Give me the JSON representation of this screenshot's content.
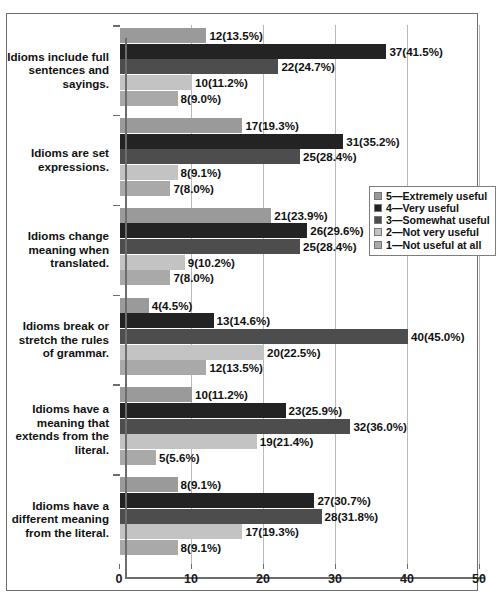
{
  "chart_data": {
    "type": "bar",
    "orientation": "horizontal",
    "title": "",
    "xlabel": "",
    "ylabel": "",
    "xlim": [
      0,
      50
    ],
    "xticks": [
      0,
      10,
      20,
      30,
      40,
      50
    ],
    "grid": true,
    "legend_position": "right",
    "categories": [
      "Idioms include full sentences and sayings.",
      "Idioms are set expressions.",
      "Idioms change meaning when translated.",
      "Idioms break or stretch the rules of grammar.",
      "Idioms have a meaning that extends from the literal.",
      "Idioms have a different meaning from the literal."
    ],
    "series": [
      {
        "name": "5—Extremely useful",
        "color": "#9a9a9a",
        "values": [
          12,
          17,
          21,
          4,
          10,
          8
        ],
        "labels": [
          "12(13.5%)",
          "17(19.3%)",
          "21(23.9%)",
          "4(4.5%)",
          "10(11.2%)",
          "8(9.1%)"
        ]
      },
      {
        "name": "4—Very useful",
        "color": "#232323",
        "values": [
          37,
          31,
          26,
          13,
          23,
          27
        ],
        "labels": [
          "37(41.5%)",
          "31(35.2%)",
          "26(29.6%)",
          "13(14.6%)",
          "23(25.9%)",
          "27(30.7%)"
        ]
      },
      {
        "name": "3—Somewhat useful",
        "color": "#4d4d4d",
        "values": [
          22,
          25,
          25,
          40,
          32,
          28
        ],
        "labels": [
          "22(24.7%)",
          "25(28.4%)",
          "25(28.4%)",
          "40(45.0%)",
          "32(36.0%)",
          "28(31.8%)"
        ]
      },
      {
        "name": "2—Not very useful",
        "color": "#c3c3c3",
        "values": [
          10,
          8,
          9,
          20,
          19,
          17
        ],
        "labels": [
          "10(11.2%)",
          "8(9.1%)",
          "9(10.2%)",
          "20(22.5%)",
          "19(21.4%)",
          "17(19.3%)"
        ]
      },
      {
        "name": "1—Not useful at all",
        "color": "#a9a9a9",
        "values": [
          8,
          7,
          7,
          12,
          5,
          8
        ],
        "labels": [
          "8(9.0%)",
          "7(8.0%)",
          "7(8.0%)",
          "12(13.5%)",
          "5(5.6%)",
          "8(9.1%)"
        ]
      }
    ]
  },
  "axis": {
    "tick_labels": [
      "0",
      "10",
      "20",
      "30",
      "40",
      "50"
    ]
  },
  "legend": {
    "items": [
      {
        "label": "5—Extremely useful",
        "color": "#9a9a9a"
      },
      {
        "label": "4—Very useful",
        "color": "#232323"
      },
      {
        "label": "3—Somewhat useful",
        "color": "#4d4d4d"
      },
      {
        "label": "2—Not very useful",
        "color": "#c3c3c3"
      },
      {
        "label": "1—Not useful at all",
        "color": "#a9a9a9"
      }
    ]
  }
}
